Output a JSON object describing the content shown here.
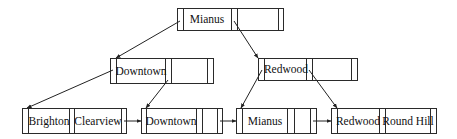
{
  "diagram": {
    "type": "B+ tree",
    "colors": {
      "stroke": "#2a2a2a",
      "text": "#111111",
      "background": "#ffffff"
    },
    "root": {
      "id": "root",
      "keys": [
        "Mianus"
      ]
    },
    "internal": [
      {
        "id": "internal-downtown",
        "keys": [
          "Downtown"
        ]
      },
      {
        "id": "internal-redwood",
        "keys": [
          "Redwood"
        ]
      }
    ],
    "leaves": [
      {
        "id": "leaf-1",
        "keys": [
          "Brighton",
          "Clearview"
        ]
      },
      {
        "id": "leaf-2",
        "keys": [
          "Downtown"
        ]
      },
      {
        "id": "leaf-3",
        "keys": [
          "Mianus"
        ]
      },
      {
        "id": "leaf-4",
        "keys": [
          "Redwood",
          "Round Hill"
        ]
      }
    ],
    "edges": [
      {
        "from": "root",
        "to": "internal-downtown"
      },
      {
        "from": "root",
        "to": "internal-redwood"
      },
      {
        "from": "internal-downtown",
        "to": "leaf-1"
      },
      {
        "from": "internal-downtown",
        "to": "leaf-2"
      },
      {
        "from": "internal-redwood",
        "to": "leaf-3"
      },
      {
        "from": "internal-redwood",
        "to": "leaf-4"
      },
      {
        "from": "leaf-1",
        "to": "leaf-2",
        "kind": "sibling"
      },
      {
        "from": "leaf-2",
        "to": "leaf-3",
        "kind": "sibling"
      },
      {
        "from": "leaf-3",
        "to": "leaf-4",
        "kind": "sibling"
      }
    ]
  }
}
